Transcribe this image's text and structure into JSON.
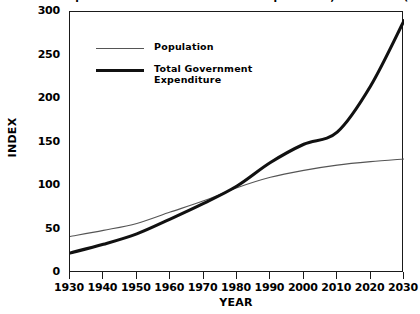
{
  "chart_data": {
    "type": "line",
    "title": "Growth in Population and Total Government Expenditure, 1930-2030 (1980=100)",
    "xlabel": "YEAR",
    "ylabel": "INDEX",
    "xlim": [
      1930,
      2030
    ],
    "ylim": [
      0,
      300
    ],
    "x_ticks": [
      "1930",
      "1940",
      "1950",
      "1960",
      "1970",
      "1980",
      "1990",
      "2000",
      "2010",
      "2020",
      "2030"
    ],
    "y_ticks": [
      "0",
      "50",
      "100",
      "150",
      "200",
      "250",
      "300"
    ],
    "grid": false,
    "legend_position": "upper-left-inside",
    "x": [
      1930,
      1940,
      1950,
      1960,
      1970,
      1980,
      1990,
      2000,
      2010,
      2020,
      2030
    ],
    "series": [
      {
        "name": "Population",
        "line_style": "thin",
        "color": "#555555",
        "values": [
          42,
          49,
          57,
          70,
          83,
          98,
          110,
          118,
          124,
          128,
          131
        ]
      },
      {
        "name": "Total Government Expenditure",
        "line_style": "thick",
        "color": "#111111",
        "values": [
          23,
          33,
          45,
          62,
          80,
          100,
          127,
          148,
          162,
          215,
          290
        ]
      }
    ]
  },
  "legend": {
    "items": [
      {
        "label": "Population"
      },
      {
        "label": "Total Government\nExpenditure"
      }
    ]
  },
  "axes": {
    "y_title": "INDEX",
    "x_title": "YEAR"
  },
  "colors": {
    "axis": "#1a1a1a",
    "population_line": "#555555",
    "expenditure_line": "#111111",
    "background": "#ffffff"
  }
}
